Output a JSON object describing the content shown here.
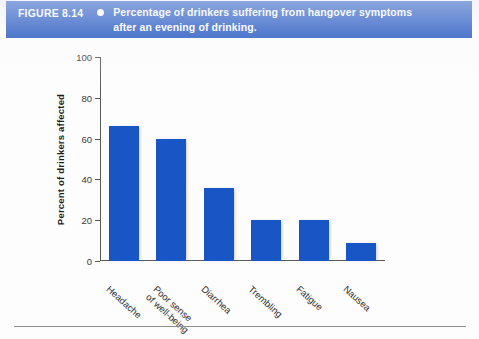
{
  "figure": {
    "number": "FIGURE 8.14",
    "bullet_icon": "bullet-dot-icon",
    "caption_line1": "Percentage of drinkers suffering from hangover symptoms",
    "caption_line2": "after an evening of drinking."
  },
  "colors": {
    "banner": "#1B51BE",
    "bar": "#1756C4",
    "axis": "#5a5a5a",
    "page": "#fdfdfd"
  },
  "chart_data": {
    "type": "bar",
    "title": "Percentage of drinkers suffering from hangover symptoms after an evening of drinking.",
    "xlabel": "",
    "ylabel": "Percent of drinkers affected",
    "ylim": [
      0,
      100
    ],
    "yticks": [
      0,
      20,
      40,
      60,
      80,
      100
    ],
    "grid": false,
    "legend": false,
    "categories": [
      "Headache",
      "Poor sense of well-being",
      "Diarrhea",
      "Trembling",
      "Fatigue",
      "Nausea"
    ],
    "category_lines": [
      [
        "Headache"
      ],
      [
        "Poor sense",
        "of well-being"
      ],
      [
        "Diarrhea"
      ],
      [
        "Trembling"
      ],
      [
        "Fatigue"
      ],
      [
        "Nausea"
      ]
    ],
    "values": [
      66,
      60,
      36,
      20,
      20,
      9
    ]
  }
}
